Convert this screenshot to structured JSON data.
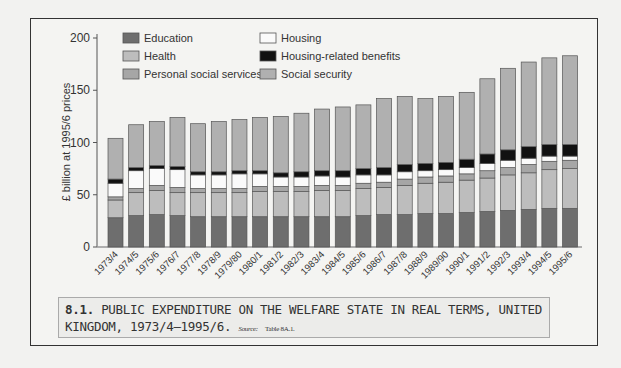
{
  "chart_data": {
    "type": "bar",
    "stacked": true,
    "title": "PUBLIC EXPENDITURE ON THE WELFARE STATE IN REAL TERMS, UNITED KINGDOM, 1973/4–1995/6.",
    "xlabel": "",
    "ylabel": "£ billion at 1995/6 prices",
    "ylim": [
      0,
      200
    ],
    "yticks": [
      0,
      50,
      100,
      150,
      200
    ],
    "grid": false,
    "legend_position": "top-left inside",
    "categories": [
      "1973/4",
      "1974/5",
      "1975/6",
      "1976/7",
      "1977/8",
      "1978/9",
      "1979/80",
      "1980/1",
      "1981/2",
      "1982/3",
      "1983/4",
      "1984/5",
      "1985/6",
      "1986/7",
      "1987/8",
      "1988/9",
      "1989/90",
      "1990/1",
      "1991/2",
      "1992/3",
      "1993/4",
      "1994/5",
      "1995/6"
    ],
    "series": [
      {
        "name": "Education",
        "color": "#6e6e6e",
        "values": [
          28,
          30,
          31,
          30,
          29,
          29,
          29,
          29,
          29,
          29,
          29,
          29,
          30,
          31,
          31,
          32,
          32,
          33,
          34,
          35,
          36,
          37,
          37
        ]
      },
      {
        "name": "Health",
        "color": "#bdbdbd",
        "values": [
          17,
          22,
          23,
          22,
          23,
          23,
          23,
          24,
          24,
          24,
          25,
          25,
          26,
          26,
          28,
          29,
          30,
          31,
          32,
          34,
          35,
          37,
          38
        ]
      },
      {
        "name": "Personal social services",
        "color": "#a6a6a6",
        "values": [
          3,
          4,
          5,
          5,
          4,
          4,
          4,
          5,
          5,
          5,
          5,
          5,
          5,
          5,
          6,
          6,
          6,
          6,
          7,
          7,
          8,
          8,
          8
        ]
      },
      {
        "name": "Housing",
        "color": "#fafafa",
        "values": [
          13,
          17,
          16,
          17,
          13,
          13,
          14,
          12,
          9,
          9,
          9,
          8,
          8,
          7,
          7,
          6,
          6,
          6,
          7,
          7,
          6,
          5,
          4
        ]
      },
      {
        "name": "Housing-related benefits",
        "color": "#111111",
        "values": [
          4,
          3,
          3,
          3,
          3,
          3,
          3,
          3,
          4,
          5,
          5,
          6,
          6,
          7,
          7,
          7,
          7,
          8,
          9,
          10,
          11,
          11,
          11
        ]
      },
      {
        "name": "Social security",
        "color": "#b0b0b0",
        "values": [
          39,
          41,
          42,
          47,
          46,
          48,
          49,
          51,
          54,
          56,
          59,
          61,
          61,
          66,
          65,
          62,
          63,
          64,
          72,
          78,
          81,
          83,
          85
        ]
      }
    ],
    "totals": [
      104,
      117,
      120,
      124,
      118,
      120,
      122,
      124,
      125,
      128,
      132,
      134,
      136,
      142,
      144,
      142,
      144,
      148,
      161,
      171,
      177,
      181,
      183
    ]
  },
  "axis": {
    "ylabel": "£ billion at 1995/6 prices",
    "ticks": [
      "0",
      "50",
      "100",
      "150",
      "200"
    ]
  },
  "legend": {
    "items": [
      {
        "label": "Education",
        "color": "#6e6e6e"
      },
      {
        "label": "Health",
        "color": "#bdbdbd"
      },
      {
        "label": "Personal social services",
        "color": "#a6a6a6"
      },
      {
        "label": "Housing",
        "color": "#fafafa"
      },
      {
        "label": "Housing-related benefits",
        "color": "#111111"
      },
      {
        "label": "Social security",
        "color": "#b0b0b0"
      }
    ]
  },
  "caption": {
    "number": "8.1.",
    "title": "PUBLIC EXPENDITURE ON THE WELFARE STATE IN REAL TERMS, UNITED KINGDOM, 1973/4–1995/6.",
    "source_label": "Source:",
    "source_text": "Table 8A.1."
  }
}
